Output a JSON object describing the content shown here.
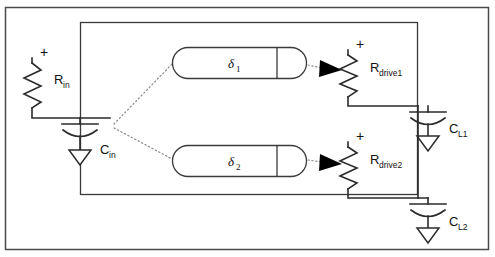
{
  "diagram": {
    "components": {
      "r_in": {
        "label": "R",
        "sub": "in",
        "polarity": "+",
        "type": "resistor"
      },
      "c_in": {
        "label": "C",
        "sub": "in",
        "type": "capacitor"
      },
      "delta1": {
        "label": "δ",
        "sub": "1",
        "type": "delay-element"
      },
      "delta2": {
        "label": "δ",
        "sub": "2",
        "type": "delay-element"
      },
      "r_drive1": {
        "label": "R",
        "sub": "drive1",
        "polarity": "+",
        "type": "resistor"
      },
      "r_drive2": {
        "label": "R",
        "sub": "drive2",
        "polarity": "+",
        "type": "resistor"
      },
      "c_l1": {
        "label": "C",
        "sub": "L1",
        "type": "capacitor"
      },
      "c_l2": {
        "label": "C",
        "sub": "L2",
        "type": "capacitor"
      }
    },
    "icons": {
      "ground": "ground-icon",
      "arrow": "arrowhead-icon"
    },
    "colors": {
      "wire": "#2b2b2b",
      "frame": "#4a4a4a",
      "dotted": "#8a8a8a",
      "arrow": "#000000",
      "background": "#ffffff"
    }
  }
}
